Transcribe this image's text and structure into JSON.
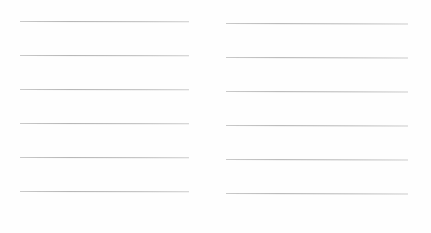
{
  "document": {
    "type": "ruled-lines-form",
    "background_color": "#ffffff",
    "rule_color": "#b0b0b0",
    "columns": [
      {
        "name": "left",
        "rules": [
          {
            "y_offset": 0
          },
          {
            "y_offset": 34
          },
          {
            "y_offset": 68
          },
          {
            "y_offset": 102
          },
          {
            "y_offset": 136
          },
          {
            "y_offset": 170
          }
        ]
      },
      {
        "name": "right",
        "rules": [
          {
            "y_offset": 0
          },
          {
            "y_offset": 34
          },
          {
            "y_offset": 68
          },
          {
            "y_offset": 102
          },
          {
            "y_offset": 136
          },
          {
            "y_offset": 170
          }
        ]
      }
    ]
  }
}
